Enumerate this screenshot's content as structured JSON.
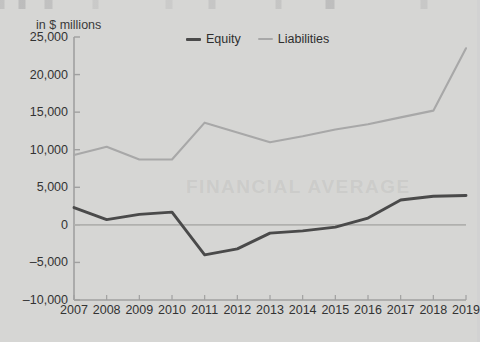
{
  "axis_unit_label": "in $ millions",
  "legend": {
    "position": "top-center",
    "entries": [
      {
        "label": "Equity",
        "color": "#4a4a4a",
        "icon": "line-swatch-icon"
      },
      {
        "label": "Liabilities",
        "color": "#a8a8a8",
        "icon": "line-swatch-icon"
      }
    ]
  },
  "watermark_text": "FINANCIAL AVERAGE",
  "colors": {
    "background": "#d6d6d4",
    "equity_line": "#4a4a4a",
    "liabilities_line": "#a8a8a8",
    "axis": "#a0a0a0",
    "zero_line": "#b0b0ae",
    "text": "#333333"
  },
  "chart_data": {
    "type": "line",
    "title": "",
    "subtitle": "",
    "xlabel": "",
    "ylabel": "in $ millions",
    "ylim": [
      -10000,
      25000
    ],
    "yticks": [
      25000,
      20000,
      15000,
      10000,
      5000,
      0,
      -5000,
      -10000
    ],
    "ytick_labels": [
      "25,000",
      "20,000",
      "15,000",
      "10,000",
      "5,000",
      "0",
      "–5,000",
      "–10,000"
    ],
    "grid": false,
    "zero_line": true,
    "legend_position": "top-center",
    "categories": [
      "2007",
      "2008",
      "2009",
      "2010",
      "2011",
      "2012",
      "2013",
      "2014",
      "2015",
      "2016",
      "2017",
      "2018",
      "2019"
    ],
    "x": [
      2007,
      2008,
      2009,
      2010,
      2011,
      2012,
      2013,
      2014,
      2015,
      2016,
      2017,
      2018,
      2019
    ],
    "series": [
      {
        "name": "Equity",
        "color": "#4a4a4a",
        "values": [
          2300,
          700,
          1400,
          1700,
          -4000,
          -3200,
          -1100,
          -800,
          -300,
          900,
          3300,
          3800,
          3900
        ]
      },
      {
        "name": "Liabilities",
        "color": "#a8a8a8",
        "values": [
          9300,
          10400,
          8700,
          8700,
          13600,
          12300,
          11000,
          11800,
          12700,
          13400,
          14300,
          15200,
          23500
        ]
      }
    ]
  }
}
